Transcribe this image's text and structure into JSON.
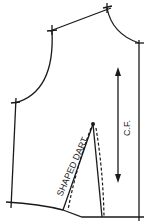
{
  "diagram": {
    "type": "bodice-front-pattern",
    "labels": {
      "center_front": "C.F.",
      "dart": "SHAPED DART"
    },
    "colors": {
      "line": "#1a1a1a",
      "background": "#ffffff"
    }
  }
}
